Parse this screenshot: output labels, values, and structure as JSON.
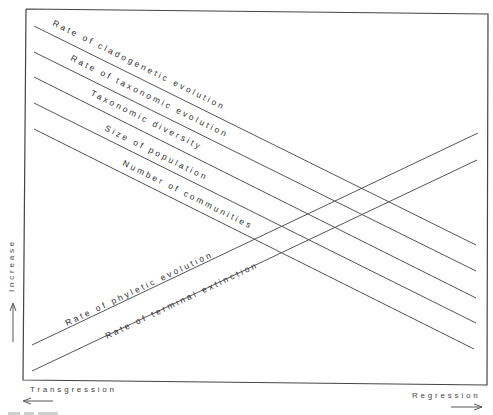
{
  "diagram": {
    "type": "conceptual line diagram",
    "y_axis": {
      "label": "Increase",
      "arrow": "up"
    },
    "x_axis": {
      "left_label": "Transgression",
      "left_arrow": "left",
      "right_label": "Regression",
      "right_arrow": "right"
    },
    "decreasing_lines": [
      {
        "label": "Rate of cladogenetic evolution"
      },
      {
        "label": "Rate of taxonomic evolution"
      },
      {
        "label": "Taxonomic diversity"
      },
      {
        "label": "Size of population"
      },
      {
        "label": "Number of communities"
      }
    ],
    "increasing_lines": [
      {
        "label": "Rate of phyletic evolution"
      },
      {
        "label": "Rate of terminal extinction"
      }
    ],
    "colors": {
      "line": "#555555",
      "frame": "#444444",
      "text": "#333333",
      "background": "#ffffff"
    }
  }
}
